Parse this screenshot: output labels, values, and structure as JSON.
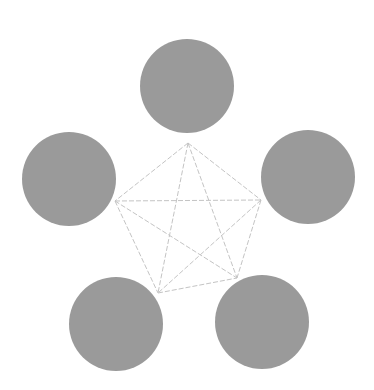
{
  "diagram": {
    "type": "complete-graph",
    "background": "#ffffff",
    "node_color": "#9a9a9a",
    "edge_color": "#c4c4c4",
    "edge_style": "dashed",
    "nodes": [
      {
        "id": "top",
        "cx": 187,
        "cy": 86,
        "r": 47,
        "anchor": [
          188,
          143
        ]
      },
      {
        "id": "left",
        "cx": 69,
        "cy": 179,
        "r": 47,
        "anchor": [
          115,
          201
        ]
      },
      {
        "id": "right",
        "cx": 308,
        "cy": 177,
        "r": 47,
        "anchor": [
          261,
          200
        ]
      },
      {
        "id": "bottom-left",
        "cx": 116,
        "cy": 324,
        "r": 47,
        "anchor": [
          158,
          293
        ]
      },
      {
        "id": "bottom-right",
        "cx": 262,
        "cy": 322,
        "r": 47,
        "anchor": [
          237,
          278
        ]
      }
    ],
    "edges": [
      [
        "top",
        "left"
      ],
      [
        "top",
        "right"
      ],
      [
        "top",
        "bottom-left"
      ],
      [
        "top",
        "bottom-right"
      ],
      [
        "left",
        "right"
      ],
      [
        "left",
        "bottom-left"
      ],
      [
        "left",
        "bottom-right"
      ],
      [
        "right",
        "bottom-left"
      ],
      [
        "right",
        "bottom-right"
      ],
      [
        "bottom-left",
        "bottom-right"
      ]
    ]
  }
}
